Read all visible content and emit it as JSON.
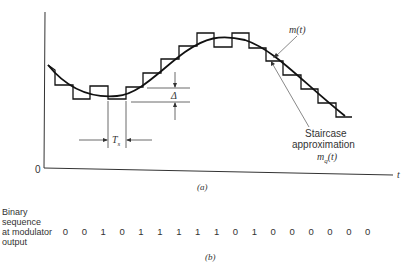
{
  "figure_a": {
    "caption": "(a)",
    "origin_label": "0",
    "time_axis_label": "t",
    "signal_label": "m(t)",
    "staircase_label_line1": "Staircase",
    "staircase_label_line2": "approximation",
    "staircase_symbol": "m",
    "staircase_symbol_subscript": "q",
    "staircase_symbol_suffix": "(t)",
    "step_size_label": "Δ",
    "sample_period_label": "T",
    "sample_period_subscript": "s"
  },
  "figure_b": {
    "caption": "(b)",
    "row_label_lines": [
      "Binary",
      "sequence",
      "at modulator",
      "output"
    ],
    "bits": [
      "0",
      "0",
      "1",
      "0",
      "1",
      "1",
      "1",
      "1",
      "1",
      "0",
      "1",
      "0",
      "0",
      "0",
      "0",
      "0",
      "0"
    ]
  },
  "colors": {
    "ink": "#1a1a1a",
    "background": "#ffffff"
  }
}
